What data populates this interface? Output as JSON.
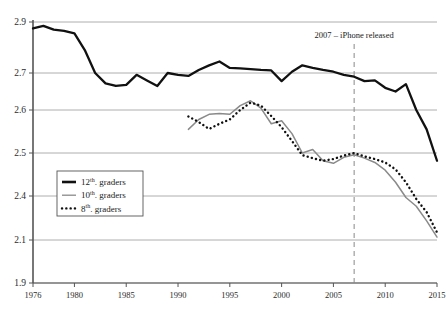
{
  "chart_data": {
    "type": "line",
    "title": "",
    "subtitle": "",
    "xlabel": "",
    "ylabel": "",
    "grid": true,
    "legend_position": "inside-left",
    "xlim": [
      1976,
      2015
    ],
    "xticks": [
      1976,
      1980,
      1985,
      1990,
      1995,
      2000,
      2005,
      2010,
      2015
    ],
    "xticklabels": [
      "1976",
      "1980",
      "1985",
      "1990",
      "1995",
      "2000",
      "2005",
      "2010",
      "2015"
    ],
    "yticks": [
      2.9,
      2.7,
      2.6,
      2.5,
      2.4,
      2.1,
      1.9
    ],
    "yticklabels": [
      "2.9",
      "2.7",
      "2.6",
      "2.5",
      "2.4",
      "2.1",
      "1.9"
    ],
    "ylim": [
      1.9,
      2.9
    ],
    "annotations": [
      {
        "text": "2007 – iPhone released",
        "x": 2007,
        "style": "vertical-dashed-line"
      }
    ],
    "series": [
      {
        "name": "12th. graders",
        "legend_label": "12th. graders",
        "style": "solid-thick",
        "color": "#111111",
        "x": [
          1976,
          1977,
          1978,
          1979,
          1980,
          1981,
          1982,
          1983,
          1984,
          1985,
          1986,
          1987,
          1988,
          1989,
          1990,
          1991,
          1992,
          1993,
          1994,
          1995,
          1996,
          1997,
          1998,
          1999,
          2000,
          2001,
          2002,
          2003,
          2004,
          2005,
          2006,
          2007,
          2008,
          2009,
          2010,
          2011,
          2012,
          2013,
          2014,
          2015
        ],
        "values": [
          2.875,
          2.885,
          2.87,
          2.865,
          2.855,
          2.79,
          2.7,
          2.672,
          2.665,
          2.668,
          2.695,
          2.68,
          2.665,
          2.7,
          2.695,
          2.692,
          2.712,
          2.73,
          2.745,
          2.72,
          2.718,
          2.715,
          2.712,
          2.71,
          2.678,
          2.705,
          2.73,
          2.72,
          2.712,
          2.705,
          2.695,
          2.69,
          2.678,
          2.68,
          2.66,
          2.65,
          2.67,
          2.6,
          2.555,
          2.482
        ]
      },
      {
        "name": "10th. graders",
        "legend_label": "10th. graders",
        "style": "solid-thin",
        "color": "#8a8a8a",
        "x": [
          1991,
          1992,
          1993,
          1994,
          1995,
          1996,
          1997,
          1998,
          1999,
          2000,
          2001,
          2002,
          2003,
          2004,
          2005,
          2006,
          2007,
          2008,
          2009,
          2010,
          2011,
          2012,
          2013,
          2014,
          2015
        ],
        "values": [
          2.555,
          2.578,
          2.59,
          2.592,
          2.59,
          2.612,
          2.625,
          2.605,
          2.568,
          2.575,
          2.545,
          2.5,
          2.508,
          2.482,
          2.476,
          2.49,
          2.496,
          2.488,
          2.478,
          2.46,
          2.432,
          2.39,
          2.33,
          2.23,
          2.12
        ]
      },
      {
        "name": "8th. graders",
        "legend_label": "8th. graders",
        "style": "dotted",
        "color": "#111111",
        "x": [
          1991,
          1992,
          1993,
          1994,
          1995,
          1996,
          1997,
          1998,
          1999,
          2000,
          2001,
          2002,
          2003,
          2004,
          2005,
          2006,
          2007,
          2008,
          2009,
          2010,
          2011,
          2012,
          2013,
          2014,
          2015
        ],
        "values": [
          2.585,
          2.572,
          2.556,
          2.568,
          2.578,
          2.6,
          2.62,
          2.612,
          2.586,
          2.56,
          2.528,
          2.495,
          2.488,
          2.482,
          2.486,
          2.494,
          2.5,
          2.492,
          2.486,
          2.478,
          2.462,
          2.432,
          2.38,
          2.29,
          2.152
        ]
      }
    ]
  },
  "legend": {
    "items": [
      {
        "label_main": "12",
        "label_sup": "th",
        "label_rest": ". graders",
        "marker": "solid-thick"
      },
      {
        "label_main": "10",
        "label_sup": "th",
        "label_rest": ". graders",
        "marker": "solid-thin"
      },
      {
        "label_main": "8",
        "label_sup": "th",
        "label_rest": ". graders",
        "marker": "dotted"
      }
    ]
  },
  "colors": {
    "grade12": "#111111",
    "grade10": "#8a8a8a",
    "grade8": "#111111",
    "grid": "#9a9a9a",
    "axis": "#555555",
    "annotation_line": "#888888",
    "background": "#ffffff"
  }
}
